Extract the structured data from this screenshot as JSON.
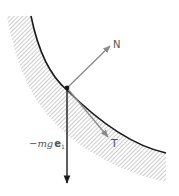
{
  "diagram": {
    "type": "free-body diagram on curved surface",
    "surface": {
      "style": "hatched",
      "curve_color": "#1a1a1a",
      "hatch_color": "#9a9a9a"
    },
    "point": {
      "label": "",
      "x": 67,
      "y": 88
    },
    "vectors": [
      {
        "name": "N",
        "label": "N",
        "color": "#8a8a8a",
        "from": [
          67,
          88
        ],
        "to": [
          110,
          46
        ]
      },
      {
        "name": "T",
        "label": "T",
        "color": "#8a8a8a",
        "from": [
          67,
          88
        ],
        "to": [
          108,
          137
        ]
      },
      {
        "name": "gravity",
        "label_prefix": "−",
        "label_italic": "mg",
        "label_bold": "e",
        "label_sub": "1",
        "color": "#1a1a1a",
        "from": [
          67,
          88
        ],
        "to": [
          67,
          183
        ]
      }
    ]
  }
}
